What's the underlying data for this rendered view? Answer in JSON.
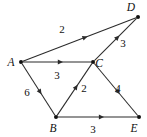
{
  "figure": {
    "type": "directed-weighted-graph",
    "background_color": "#ffffff",
    "ink_color": "#111111",
    "width": 147,
    "height": 137
  },
  "nodes": [
    {
      "id": "A",
      "label": "A",
      "x": 21,
      "y": 62,
      "label_x": 11,
      "label_y": 66
    },
    {
      "id": "B",
      "label": "B",
      "x": 56,
      "y": 117,
      "label_x": 53,
      "label_y": 132
    },
    {
      "id": "C",
      "label": "C",
      "x": 93,
      "y": 62,
      "label_x": 99,
      "label_y": 67
    },
    {
      "id": "D",
      "label": "D",
      "x": 138,
      "y": 17,
      "label_x": 131,
      "label_y": 11
    },
    {
      "id": "E",
      "label": "E",
      "x": 139,
      "y": 117,
      "label_x": 134,
      "label_y": 132
    }
  ],
  "edges": [
    {
      "from": "A",
      "to": "D",
      "weight": "2",
      "label_x": 62,
      "label_y": 33
    },
    {
      "from": "A",
      "to": "C",
      "weight": "3",
      "label_x": 57,
      "label_y": 79
    },
    {
      "from": "A",
      "to": "B",
      "weight": "6",
      "label_x": 27,
      "label_y": 96
    },
    {
      "from": "B",
      "to": "C",
      "weight": "2",
      "label_x": 84,
      "label_y": 92
    },
    {
      "from": "B",
      "to": "E",
      "weight": "3",
      "label_x": 93,
      "label_y": 133
    },
    {
      "from": "C",
      "to": "D",
      "weight": "3",
      "label_x": 123,
      "label_y": 47
    },
    {
      "from": "C",
      "to": "E",
      "weight": "4",
      "label_x": 118,
      "label_y": 92
    }
  ],
  "chart_data": {
    "type": "diagram",
    "title": "",
    "vertices": [
      "A",
      "B",
      "C",
      "D",
      "E"
    ],
    "directed": true,
    "weighted": true,
    "adjacency": [
      {
        "source": "A",
        "target": "D",
        "weight": 2
      },
      {
        "source": "A",
        "target": "C",
        "weight": 3
      },
      {
        "source": "A",
        "target": "B",
        "weight": 6
      },
      {
        "source": "B",
        "target": "C",
        "weight": 2
      },
      {
        "source": "B",
        "target": "E",
        "weight": 3
      },
      {
        "source": "C",
        "target": "D",
        "weight": 3
      },
      {
        "source": "C",
        "target": "E",
        "weight": 4
      }
    ]
  }
}
